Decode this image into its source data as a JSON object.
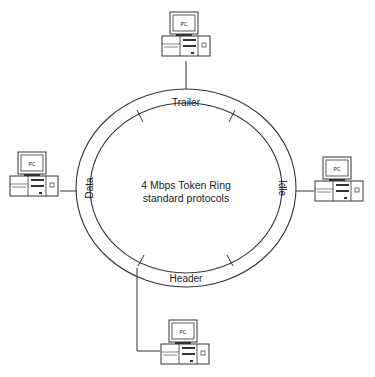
{
  "diagram": {
    "title_line1": "4 Mbps  Token Ring",
    "title_line2": "standard protocols",
    "segments": {
      "top": "Trailer",
      "right": "Idle",
      "bottom": "Header",
      "left": "Data"
    },
    "nodes": [
      {
        "id": "top",
        "label": "PC"
      },
      {
        "id": "left",
        "label": "PC"
      },
      {
        "id": "right",
        "label": "PC"
      },
      {
        "id": "bottom",
        "label": "PC"
      }
    ],
    "colors": {
      "line": "#333333",
      "background": "#ffffff"
    }
  }
}
